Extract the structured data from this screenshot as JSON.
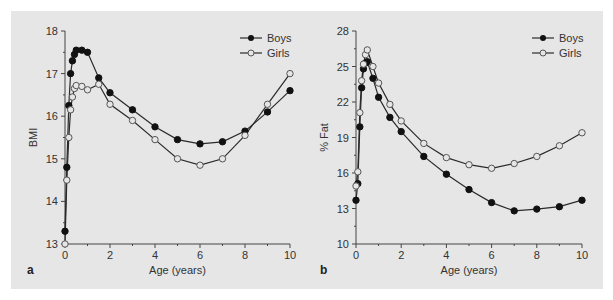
{
  "chart_data": [
    {
      "type": "line",
      "panel": "a",
      "title": "",
      "xlabel": "Age (years)",
      "ylabel": "BMI",
      "xlim": [
        0,
        10
      ],
      "ylim": [
        13,
        18
      ],
      "xticks": [
        0,
        2,
        4,
        6,
        8,
        10
      ],
      "yticks": [
        13,
        14,
        15,
        16,
        17,
        18
      ],
      "grid": false,
      "legend_position": "top-right",
      "series": [
        {
          "name": "Boys",
          "marker": "filled-circle",
          "x": [
            0,
            0.08,
            0.17,
            0.25,
            0.33,
            0.42,
            0.5,
            0.75,
            1,
            1.5,
            2,
            3,
            4,
            5,
            6,
            7,
            8,
            9,
            10
          ],
          "y": [
            13.3,
            14.8,
            16.25,
            17.0,
            17.3,
            17.45,
            17.55,
            17.55,
            17.5,
            16.9,
            16.55,
            16.15,
            15.75,
            15.45,
            15.35,
            15.4,
            15.65,
            16.1,
            16.6
          ]
        },
        {
          "name": "Girls",
          "marker": "open-circle",
          "x": [
            0,
            0.08,
            0.17,
            0.25,
            0.33,
            0.42,
            0.5,
            0.75,
            1,
            1.5,
            2,
            3,
            4,
            5,
            6,
            7,
            8,
            9,
            10
          ],
          "y": [
            13.0,
            14.5,
            15.5,
            16.15,
            16.45,
            16.65,
            16.72,
            16.7,
            16.62,
            16.75,
            16.28,
            15.9,
            15.45,
            15.0,
            14.85,
            15.0,
            15.55,
            16.28,
            17.0
          ]
        }
      ]
    },
    {
      "type": "line",
      "panel": "b",
      "title": "",
      "xlabel": "Age (years)",
      "ylabel": "% Fat",
      "xlim": [
        0,
        10
      ],
      "ylim": [
        10,
        28
      ],
      "xticks": [
        0,
        2,
        4,
        6,
        8,
        10
      ],
      "yticks": [
        10,
        13,
        16,
        19,
        22,
        25,
        28
      ],
      "grid": false,
      "legend_position": "top-right",
      "series": [
        {
          "name": "Boys",
          "marker": "filled-circle",
          "x": [
            0,
            0.08,
            0.17,
            0.25,
            0.33,
            0.42,
            0.5,
            0.75,
            1,
            1.5,
            2,
            3,
            4,
            5,
            6,
            7,
            8,
            9,
            10
          ],
          "y": [
            13.7,
            15.1,
            19.9,
            23.2,
            24.8,
            25.3,
            25.4,
            24.0,
            22.4,
            20.7,
            19.5,
            17.4,
            15.9,
            14.6,
            13.5,
            12.8,
            12.95,
            13.15,
            13.7
          ]
        },
        {
          "name": "Girls",
          "marker": "open-circle",
          "x": [
            0,
            0.08,
            0.17,
            0.25,
            0.33,
            0.42,
            0.5,
            0.75,
            1,
            1.5,
            2,
            3,
            4,
            5,
            6,
            7,
            8,
            9,
            10
          ],
          "y": [
            14.9,
            16.1,
            21.1,
            23.8,
            25.2,
            26.0,
            26.4,
            25.0,
            23.6,
            21.8,
            20.4,
            18.5,
            17.3,
            16.7,
            16.4,
            16.8,
            17.4,
            18.3,
            19.4
          ]
        }
      ]
    }
  ],
  "panels": [
    {
      "letter": "a",
      "xlabel": "Age (years)",
      "ylabel": "BMI",
      "legend": [
        "Boys",
        "Girls"
      ]
    },
    {
      "letter": "b",
      "xlabel": "Age (years)",
      "ylabel": "% Fat",
      "legend": [
        "Boys",
        "Girls"
      ]
    }
  ],
  "colors": {
    "panel_bg": "#e6e6e6",
    "line": "#2a2a2a",
    "filled_marker": "#111111",
    "open_marker_fill": "#e6e6e6"
  }
}
